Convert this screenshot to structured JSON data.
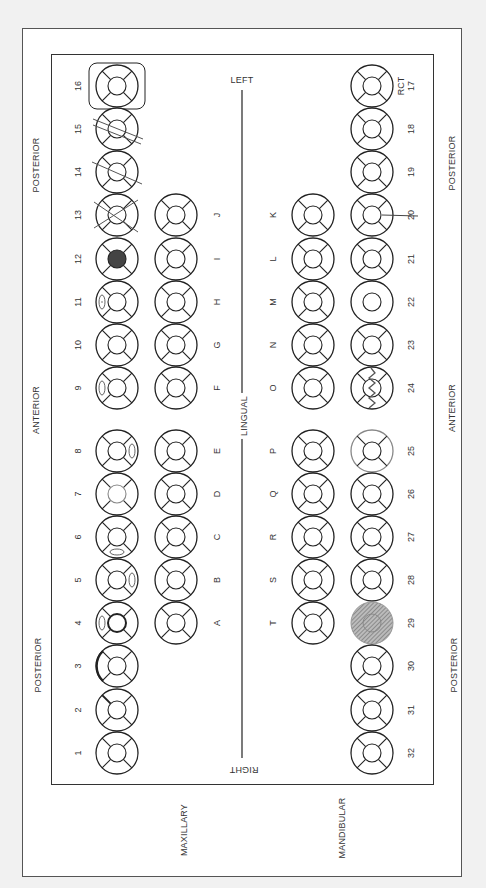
{
  "frame": {
    "side_labels": {
      "maxillary": "MAXILLARY",
      "mandibular": "MANDIBULAR"
    },
    "region_labels": {
      "max_posterior_top": "POSTERIOR",
      "max_anterior": "ANTERIOR",
      "max_posterior_bottom": "POSTERIOR",
      "mand_posterior_top": "POSTERIOR",
      "mand_anterior": "ANTERIOR",
      "mand_posterior_bottom": "POSTERIOR"
    },
    "orientation": {
      "left": "LEFT",
      "lingual": "LINGUAL",
      "right": "RIGHT"
    }
  },
  "maxillary_permanent": [
    {
      "number": "16",
      "condition": "boxed"
    },
    {
      "number": "15",
      "condition": "double-slash"
    },
    {
      "number": "14",
      "condition": "single-slash"
    },
    {
      "number": "13",
      "condition": "x-extracted"
    },
    {
      "number": "12",
      "condition": "occlusal-filled"
    },
    {
      "number": "11",
      "condition": "mesial-oval-dot"
    },
    {
      "number": "10",
      "condition": "modified-spoke"
    },
    {
      "number": "9",
      "condition": "mesial-oval"
    },
    {
      "number": "8",
      "condition": "distal-oval"
    },
    {
      "number": "7",
      "condition": "occlusal-gray"
    },
    {
      "number": "6",
      "condition": "facial-oval"
    },
    {
      "number": "5",
      "condition": "distal-oval"
    },
    {
      "number": "4",
      "condition": "mesial-oval-bold-center"
    },
    {
      "number": "3",
      "condition": "bold-mesial-arc"
    },
    {
      "number": "2",
      "condition": "bold-spoke"
    },
    {
      "number": "1",
      "condition": "none"
    }
  ],
  "maxillary_primary": [
    {
      "letter": "J"
    },
    {
      "letter": "I"
    },
    {
      "letter": "H"
    },
    {
      "letter": "G"
    },
    {
      "letter": "F"
    },
    {
      "letter": "E"
    },
    {
      "letter": "D"
    },
    {
      "letter": "C"
    },
    {
      "letter": "B"
    },
    {
      "letter": "A"
    }
  ],
  "mandibular_primary": [
    {
      "letter": "K"
    },
    {
      "letter": "L"
    },
    {
      "letter": "M"
    },
    {
      "letter": "N"
    },
    {
      "letter": "O"
    },
    {
      "letter": "P"
    },
    {
      "letter": "Q"
    },
    {
      "letter": "R"
    },
    {
      "letter": "S"
    },
    {
      "letter": "T"
    }
  ],
  "mandibular_permanent": [
    {
      "number": "17",
      "condition": "rct",
      "note": "RCT"
    },
    {
      "number": "18",
      "condition": "none"
    },
    {
      "number": "19",
      "condition": "none"
    },
    {
      "number": "20",
      "condition": "root-line"
    },
    {
      "number": "21",
      "condition": "none"
    },
    {
      "number": "22",
      "condition": "no-spokes"
    },
    {
      "number": "23",
      "condition": "none"
    },
    {
      "number": "24",
      "condition": "fracture-zigzag"
    },
    {
      "number": "25",
      "condition": "gray-outline"
    },
    {
      "number": "26",
      "condition": "none"
    },
    {
      "number": "27",
      "condition": "none"
    },
    {
      "number": "28",
      "condition": "none"
    },
    {
      "number": "29",
      "condition": "hatched"
    },
    {
      "number": "30",
      "condition": "none"
    },
    {
      "number": "31",
      "condition": "none"
    },
    {
      "number": "32",
      "condition": "none"
    }
  ],
  "colors": {
    "ink": "#222222",
    "gray_ink": "#888888",
    "fill_dark": "#444444",
    "hatch": "#777777"
  }
}
